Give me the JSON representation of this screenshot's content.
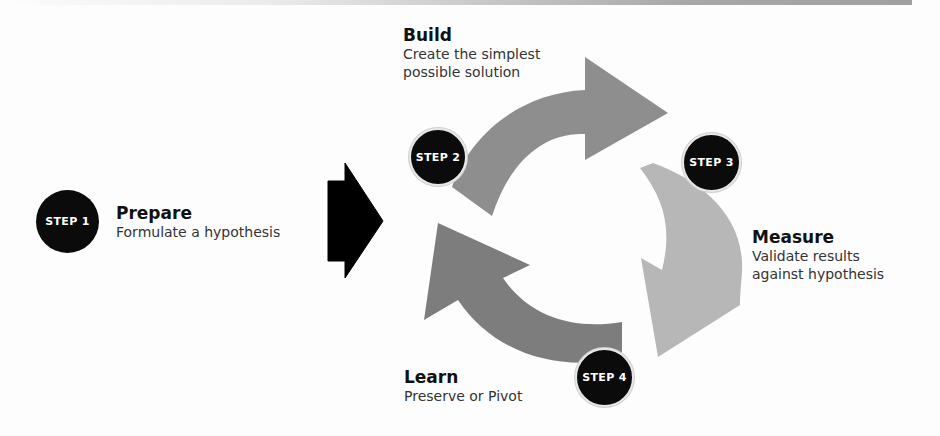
{
  "diagram": {
    "type": "process-cycle",
    "colors": {
      "badge": "#0b0b0b",
      "badge_text": "#ffffff",
      "arrow_build": "#8e8e8e",
      "arrow_measure": "#b7b7b7",
      "arrow_learn": "#7d7d7d",
      "entry_arrow": "#000000"
    },
    "steps": [
      {
        "badge": "STEP 1",
        "title": "Prepare",
        "desc_lines": [
          "Formulate a hypothesis"
        ]
      },
      {
        "badge": "STEP 2",
        "title": "Build",
        "desc_lines": [
          "Create the simplest",
          "possible solution"
        ]
      },
      {
        "badge": "STEP 3",
        "title": "Measure",
        "desc_lines": [
          "Validate results",
          "against hypothesis"
        ]
      },
      {
        "badge": "STEP 4",
        "title": "Learn",
        "desc_lines": [
          "Preserve or Pivot"
        ]
      }
    ]
  }
}
